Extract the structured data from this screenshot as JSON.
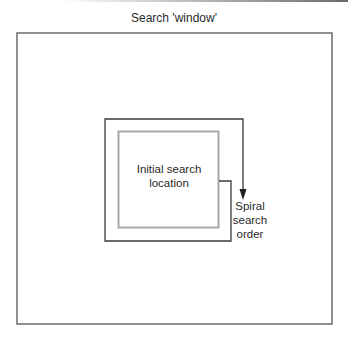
{
  "title": "Search 'window'",
  "labels": {
    "initial_line1": "Initial search",
    "initial_line2": "location",
    "spiral_line1": "Spiral",
    "spiral_line2": "search",
    "spiral_line3": "order"
  },
  "colors": {
    "outer_box": "#6b6b6b",
    "spiral_path": "#3a3a3a",
    "initial_box": "#a8a8a8",
    "text": "#2a2a2a"
  }
}
